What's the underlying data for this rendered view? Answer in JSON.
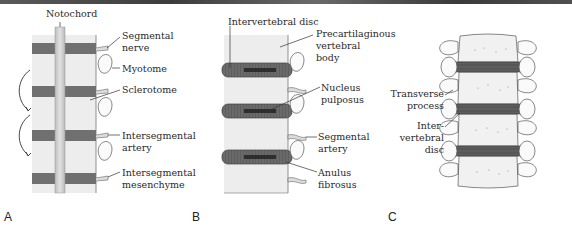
{
  "figure": {
    "panels": [
      {
        "letter": "A",
        "labels": {
          "notochord": "Notochord",
          "segmental_nerve_1": "Segmental",
          "segmental_nerve_2": "nerve",
          "myotome": "Myotome",
          "sclerotome": "Sclerotome",
          "intersegmental_artery_1": "Intersegmental",
          "intersegmental_artery_2": "artery",
          "intersegmental_mesenchyme_1": "Intersegmental",
          "intersegmental_mesenchyme_2": "mesenchyme"
        }
      },
      {
        "letter": "B",
        "labels": {
          "intervertebral_disc": "Intervertebral disc",
          "precartilaginous_1": "Precartilaginous",
          "precartilaginous_2": "vertebral",
          "precartilaginous_3": "body",
          "nucleus_1": "Nucleus",
          "nucleus_2": "pulposus",
          "segmental_artery_1": "Segmental",
          "segmental_artery_2": "artery",
          "anulus_1": "Anulus",
          "anulus_2": "fibrosus"
        }
      },
      {
        "letter": "C",
        "labels": {
          "transverse_1": "Transverse",
          "transverse_2": "process",
          "disc_1": "Inter-",
          "disc_2": "vertebral",
          "disc_3": "disc"
        }
      }
    ],
    "colors": {
      "segment_dark": "#6e6e6e",
      "tissue_light": "#ececec",
      "notochord": "#d2d2d2",
      "outline": "#555555",
      "text": "#2a2a2a"
    }
  }
}
